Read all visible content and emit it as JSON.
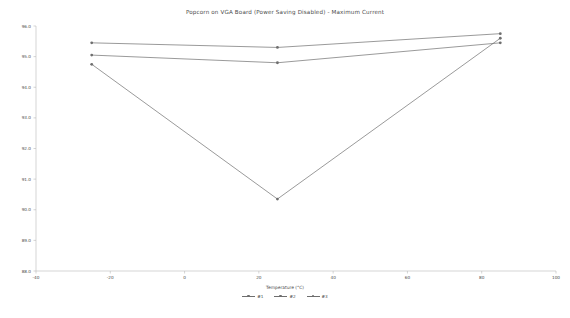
{
  "chart_data": {
    "type": "line",
    "title": "Popcorn on VGA Board (Power Saving Disabled) - Maximum Current",
    "xlabel": "Temperature (°C)",
    "ylabel": "VBUS Current (IBUS) (mA)",
    "xlim": [
      -40,
      100
    ],
    "ylim": [
      88.0,
      96.0
    ],
    "xticks": [
      -40,
      -20,
      0,
      20,
      40,
      60,
      80,
      100
    ],
    "xtick_labels": [
      "-40",
      "-20",
      "0",
      "20",
      "40",
      "60",
      "80",
      "100"
    ],
    "yticks": [
      88.0,
      89.0,
      90.0,
      91.0,
      92.0,
      93.0,
      94.0,
      95.0,
      96.0
    ],
    "ytick_labels": [
      "88.0",
      "89.0",
      "90.0",
      "91.0",
      "92.0",
      "93.0",
      "94.0",
      "95.0",
      "96.0"
    ],
    "grid": false,
    "legend_position": "bottom",
    "x": [
      -25,
      25,
      85
    ],
    "series": [
      {
        "name": "#1",
        "values": [
          95.45,
          95.3,
          95.75
        ],
        "color": "#6e6e6e"
      },
      {
        "name": "#2",
        "values": [
          95.05,
          94.8,
          95.45
        ],
        "color": "#6e6e6e"
      },
      {
        "name": "#3",
        "values": [
          94.75,
          90.35,
          95.6
        ],
        "color": "#6e6e6e"
      }
    ]
  },
  "axis": {
    "spine_color": "#b9b9b9",
    "tick_color": "#b9b9b9"
  }
}
